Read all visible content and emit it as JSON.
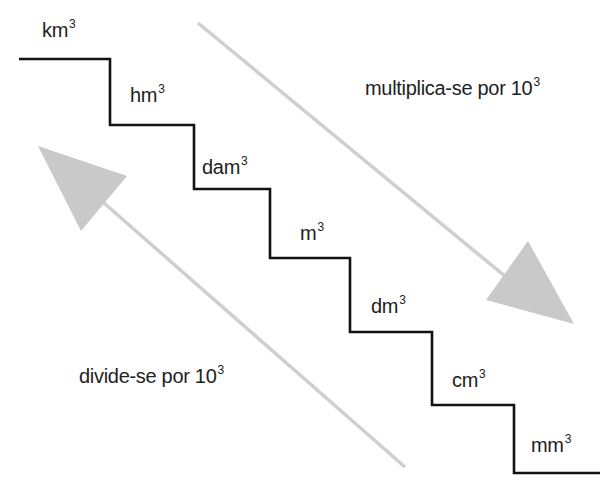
{
  "diagram": {
    "steps": [
      {
        "unit": "km",
        "exp": "3"
      },
      {
        "unit": "hm",
        "exp": "3"
      },
      {
        "unit": "dam",
        "exp": "3"
      },
      {
        "unit": "m",
        "exp": "3"
      },
      {
        "unit": "dm",
        "exp": "3"
      },
      {
        "unit": "cm",
        "exp": "3"
      },
      {
        "unit": "mm",
        "exp": "3"
      }
    ],
    "down_arrow": {
      "text": "multiplica-se por 10",
      "exp": "3"
    },
    "up_arrow": {
      "text": "divide-se por 10",
      "exp": "3"
    },
    "colors": {
      "stair": "#111111",
      "arrow": "#c8c8c8",
      "text": "#222222"
    }
  }
}
